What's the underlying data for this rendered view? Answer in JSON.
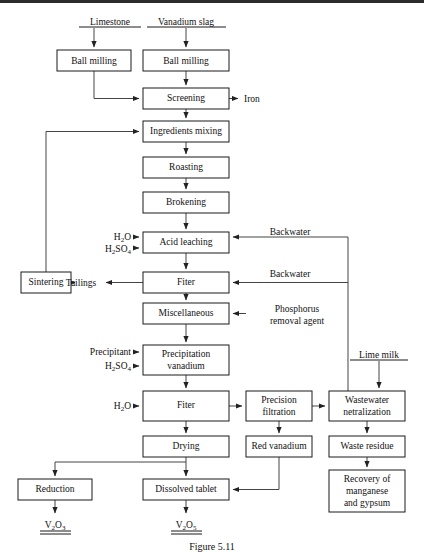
{
  "figure": {
    "domain": "diagram",
    "type": "process-flowchart",
    "title_caption": "Figure 5.11",
    "top_rule": true
  },
  "sources": [
    {
      "id": "limestone",
      "label": "Limestone",
      "x": 110,
      "y": 22
    },
    {
      "id": "vanadium-slag",
      "label": "Vanadium slag",
      "x": 186,
      "y": 22
    },
    {
      "id": "lime-milk",
      "label": "Lime milk",
      "x": 378,
      "y": 355
    }
  ],
  "boxes": [
    {
      "id": "ball-milling-left",
      "label": "Ball milling",
      "x": 57,
      "y": 50,
      "w": 74,
      "h": 21,
      "lines": [
        "Ball milling"
      ]
    },
    {
      "id": "ball-milling-right",
      "label": "Ball milling",
      "x": 143,
      "y": 50,
      "w": 86,
      "h": 21,
      "lines": [
        "Ball milling"
      ]
    },
    {
      "id": "screening",
      "label": "Screening",
      "x": 143,
      "y": 88,
      "w": 86,
      "h": 21,
      "lines": [
        "Screening"
      ]
    },
    {
      "id": "ingredients-mixing",
      "label": "Ingredients mixing",
      "x": 143,
      "y": 121,
      "w": 86,
      "h": 21,
      "lines": [
        "Ingredients mixing"
      ]
    },
    {
      "id": "roasting",
      "label": "Roasting",
      "x": 143,
      "y": 157,
      "w": 86,
      "h": 21,
      "lines": [
        "Roasting"
      ]
    },
    {
      "id": "brokening",
      "label": "Brokening",
      "x": 143,
      "y": 192,
      "w": 86,
      "h": 21,
      "lines": [
        "Brokening"
      ]
    },
    {
      "id": "acid-leaching",
      "label": "Acid leaching",
      "x": 143,
      "y": 232,
      "w": 86,
      "h": 21,
      "lines": [
        "Acid leaching"
      ]
    },
    {
      "id": "fiter-1",
      "label": "Fiter",
      "x": 143,
      "y": 272,
      "w": 86,
      "h": 21,
      "lines": [
        "Fiter"
      ]
    },
    {
      "id": "sintering",
      "label": "Sintering",
      "x": 21,
      "y": 272,
      "w": 50,
      "h": 21,
      "lines": [
        "Sintering"
      ]
    },
    {
      "id": "miscellaneous",
      "label": "Miscellaneous",
      "x": 143,
      "y": 303,
      "w": 86,
      "h": 21,
      "lines": [
        "Miscellaneous"
      ]
    },
    {
      "id": "precipitation-vanadium",
      "label": "Precipitation vanadium",
      "x": 143,
      "y": 345,
      "w": 86,
      "h": 30,
      "lines": [
        "Precipitation",
        "vanadium"
      ]
    },
    {
      "id": "fiter-2",
      "label": "Fiter",
      "x": 143,
      "y": 391,
      "w": 86,
      "h": 30,
      "lines": [
        "Fiter"
      ]
    },
    {
      "id": "precision-filtration",
      "label": "Precision filtration",
      "x": 246,
      "y": 391,
      "w": 66,
      "h": 30,
      "lines": [
        "Precision",
        "filtration"
      ]
    },
    {
      "id": "wastewater-netralization",
      "label": "Wastewater netralization",
      "x": 329,
      "y": 391,
      "w": 76,
      "h": 30,
      "lines": [
        "Wastewater",
        "netralization"
      ]
    },
    {
      "id": "drying",
      "label": "Drying",
      "x": 143,
      "y": 436,
      "w": 86,
      "h": 21,
      "lines": [
        "Drying"
      ]
    },
    {
      "id": "red-vanadium",
      "label": "Red vanadium",
      "x": 246,
      "y": 436,
      "w": 66,
      "h": 21,
      "lines": [
        "Red vanadium"
      ]
    },
    {
      "id": "waste-residue",
      "label": "Waste residue",
      "x": 329,
      "y": 436,
      "w": 76,
      "h": 21,
      "lines": [
        "Waste residue"
      ]
    },
    {
      "id": "reduction",
      "label": "Reduction",
      "x": 18,
      "y": 479,
      "w": 74,
      "h": 21,
      "lines": [
        "Reduction"
      ]
    },
    {
      "id": "dissolved-tablet",
      "label": "Dissolved tablet",
      "x": 143,
      "y": 479,
      "w": 86,
      "h": 21,
      "lines": [
        "Dissolved tablet"
      ]
    },
    {
      "id": "recovery-of-manganese-and-gypsum",
      "label": "Recovery of manganese and gypsum",
      "x": 329,
      "y": 470,
      "w": 76,
      "h": 42,
      "lines": [
        "Recovery of",
        "manganese",
        "and gypsum"
      ]
    }
  ],
  "reagent_labels": [
    {
      "id": "h2o-acid-leaching",
      "text": "H",
      "sub": "2",
      "text2": "O",
      "x": 128,
      "y": 230
    },
    {
      "id": "h2so4-acid-leaching",
      "text": "H",
      "sub": "2",
      "text2": "SO",
      "sub2": "4",
      "x": 128,
      "y": 246
    },
    {
      "id": "precipitant",
      "text": "Precipitant",
      "x": 128,
      "y": 350
    },
    {
      "id": "h2so4-precipitation",
      "text": "H",
      "sub": "2",
      "text2": "SO",
      "sub2": "4",
      "x": 128,
      "y": 365
    },
    {
      "id": "h2o-fiter2",
      "text": "H",
      "sub": "2",
      "text2": "O",
      "x": 128,
      "y": 406
    }
  ],
  "stream_labels": [
    {
      "id": "iron",
      "text": "Iron",
      "x": 247,
      "y": 98
    },
    {
      "id": "tailings",
      "text": "Tailings",
      "x": 81,
      "y": 282
    },
    {
      "id": "backwater-acid-leaching",
      "text": "Backwater",
      "x": 270,
      "y": 234
    },
    {
      "id": "backwater-fiter",
      "text": "Backwater",
      "x": 270,
      "y": 274
    },
    {
      "id": "phosphorus-removal-agent-l1",
      "text": "Phosphorus",
      "x": 254,
      "y": 312
    },
    {
      "id": "phosphorus-removal-agent-l2",
      "text": "removal agent",
      "x": 254,
      "y": 324
    }
  ],
  "products": [
    {
      "id": "v2o3",
      "base": "V",
      "sub": "2",
      "mid": "O",
      "sub2": "3",
      "x": 55,
      "y": 523
    },
    {
      "id": "v2o5",
      "base": "V",
      "sub": "2",
      "mid": "O",
      "sub2": "5",
      "x": 186,
      "y": 523
    }
  ],
  "colors": {
    "box_stroke": "#1a1a1a",
    "line": "#444444",
    "text": "#111111",
    "rule": "#2b2b2b",
    "background": "#ffffff"
  }
}
